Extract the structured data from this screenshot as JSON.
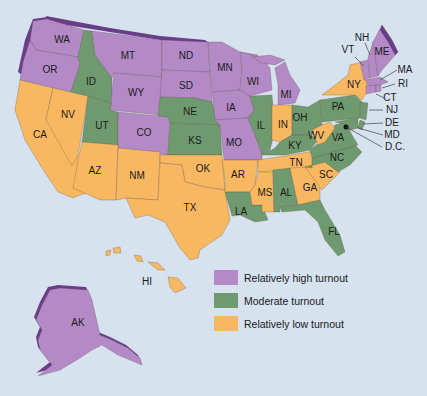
{
  "colors": {
    "high": "#b48ac6",
    "high_edge": "#6a3d8a",
    "moderate": "#6f9a6f",
    "low": "#f8b862",
    "background": "#d6e2ee"
  },
  "legend": {
    "items": [
      {
        "key": "high",
        "label": "Relatively high turnout",
        "color": "#b48ac6"
      },
      {
        "key": "moderate",
        "label": "Moderate turnout",
        "color": "#6f9a6f"
      },
      {
        "key": "low",
        "label": "Relatively low turnout",
        "color": "#f8b862"
      }
    ]
  },
  "states": {
    "WA": {
      "label": "WA",
      "category": "high"
    },
    "OR": {
      "label": "OR",
      "category": "high"
    },
    "CA": {
      "label": "CA",
      "category": "low"
    },
    "NV": {
      "label": "NV",
      "category": "low"
    },
    "ID": {
      "label": "ID",
      "category": "moderate"
    },
    "MT": {
      "label": "MT",
      "category": "high"
    },
    "WY": {
      "label": "WY",
      "category": "high"
    },
    "UT": {
      "label": "UT",
      "category": "moderate"
    },
    "CO": {
      "label": "CO",
      "category": "high"
    },
    "AZ": {
      "label": "AZ",
      "category": "low"
    },
    "NM": {
      "label": "NM",
      "category": "low"
    },
    "ND": {
      "label": "ND",
      "category": "high"
    },
    "SD": {
      "label": "SD",
      "category": "high"
    },
    "NE": {
      "label": "NE",
      "category": "moderate"
    },
    "KS": {
      "label": "KS",
      "category": "moderate"
    },
    "OK": {
      "label": "OK",
      "category": "low"
    },
    "TX": {
      "label": "TX",
      "category": "low"
    },
    "MN": {
      "label": "MN",
      "category": "high"
    },
    "IA": {
      "label": "IA",
      "category": "high"
    },
    "MO": {
      "label": "MO",
      "category": "high"
    },
    "AR": {
      "label": "AR",
      "category": "low"
    },
    "LA": {
      "label": "LA",
      "category": "moderate"
    },
    "WI": {
      "label": "WI",
      "category": "high"
    },
    "IL": {
      "label": "IL",
      "category": "moderate"
    },
    "MI": {
      "label": "MI",
      "category": "high"
    },
    "IN": {
      "label": "IN",
      "category": "low"
    },
    "OH": {
      "label": "OH",
      "category": "moderate"
    },
    "KY": {
      "label": "KY",
      "category": "moderate"
    },
    "TN": {
      "label": "TN",
      "category": "low"
    },
    "MS": {
      "label": "MS",
      "category": "low"
    },
    "AL": {
      "label": "AL",
      "category": "moderate"
    },
    "GA": {
      "label": "GA",
      "category": "low"
    },
    "FL": {
      "label": "FL",
      "category": "moderate"
    },
    "SC": {
      "label": "SC",
      "category": "low"
    },
    "NC": {
      "label": "NC",
      "category": "moderate"
    },
    "VA": {
      "label": "VA",
      "category": "moderate"
    },
    "WV": {
      "label": "WV",
      "category": "low"
    },
    "PA": {
      "label": "PA",
      "category": "moderate"
    },
    "NY": {
      "label": "NY",
      "category": "low"
    },
    "VT": {
      "label": "VT",
      "category": "high"
    },
    "NH": {
      "label": "NH",
      "category": "high"
    },
    "ME": {
      "label": "ME",
      "category": "high"
    },
    "MA": {
      "label": "MA",
      "category": "high"
    },
    "RI": {
      "label": "RI",
      "category": "high"
    },
    "CT": {
      "label": "CT",
      "category": "high"
    },
    "NJ": {
      "label": "NJ",
      "category": "moderate"
    },
    "DE": {
      "label": "DE",
      "category": "moderate"
    },
    "MD": {
      "label": "MD",
      "category": "moderate"
    },
    "DC": {
      "label": "D.C.",
      "category": "moderate"
    },
    "AK": {
      "label": "AK",
      "category": "high"
    },
    "HI": {
      "label": "HI",
      "category": "low"
    }
  }
}
